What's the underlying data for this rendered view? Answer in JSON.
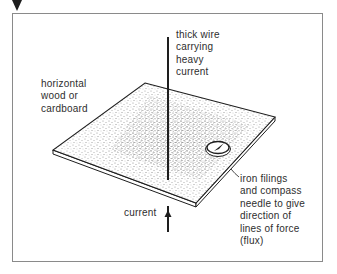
{
  "figure": {
    "labels": {
      "wire": "thick wire\ncarrying\nheavy\ncurrent",
      "board": "horizontal\nwood or\ncardboard",
      "filings": "iron filings\nand compass\nneedle to give\ndirection of\nlines of force\n(flux)",
      "current": "current"
    },
    "elements": {
      "marker": "down-triangle-marker",
      "wire": "vertical-wire",
      "board": "stippled-board",
      "compass": "compass-icon",
      "arrow": "current-arrow-up"
    },
    "colors": {
      "ink": "#1e1e1e",
      "frame": "#8a8a8a",
      "stipple": "#555555",
      "background": "#ffffff"
    }
  }
}
